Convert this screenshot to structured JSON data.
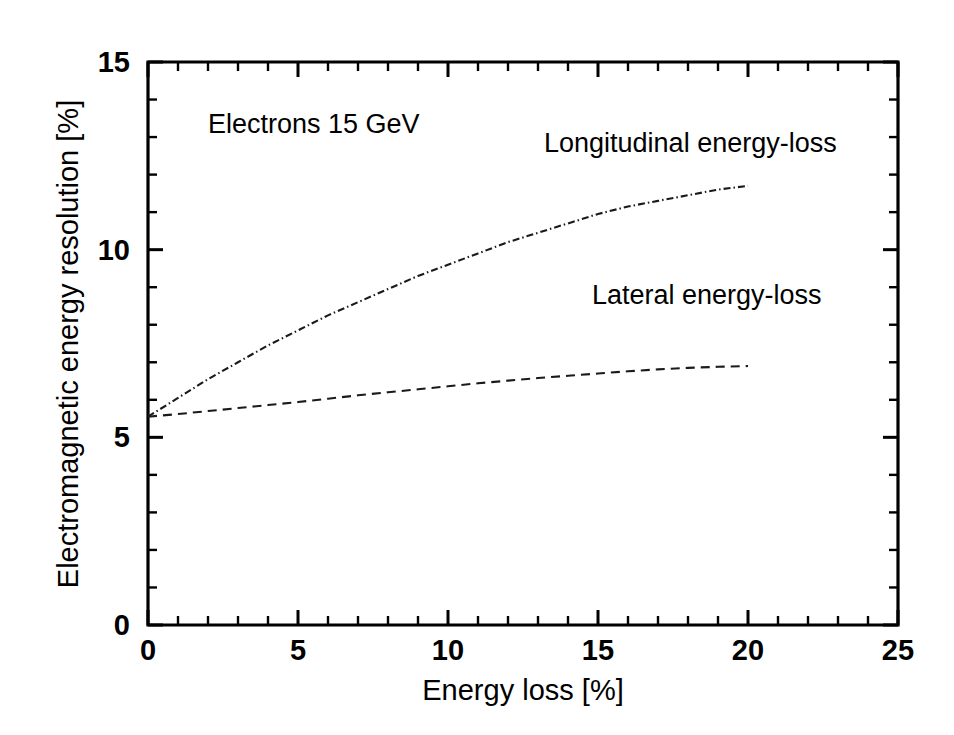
{
  "chart_data": {
    "type": "line",
    "title": "",
    "subtitle": "",
    "xlabel": "Energy loss    [%]",
    "ylabel": "Electromagnetic energy resolution    [%]",
    "xlim": [
      0,
      25
    ],
    "ylim": [
      0,
      15
    ],
    "xticks": [
      0,
      5,
      10,
      15,
      20,
      25
    ],
    "yticks": [
      0,
      5,
      10,
      15
    ],
    "xtick_labels": [
      "0",
      "5",
      "10",
      "15",
      "20",
      "25"
    ],
    "ytick_labels": [
      "0",
      "5",
      "10",
      "15"
    ],
    "x_minor_tick_step": 1,
    "y_minor_tick_step": 1,
    "grid": false,
    "legend_position": "inline-annotations",
    "annotations": [
      {
        "text": "Electrons   15 GeV",
        "x": 2.0,
        "y": 13.1
      },
      {
        "text": "Longitudinal energy-loss",
        "x": 13.2,
        "y": 12.6
      },
      {
        "text": "Lateral energy-loss",
        "x": 14.8,
        "y": 8.55
      }
    ],
    "series": [
      {
        "name": "Longitudinal energy-loss",
        "style": "dash-dot",
        "color": "#1a1a1a",
        "x": [
          0,
          1,
          2,
          3,
          4,
          5,
          6,
          7,
          8,
          9,
          10,
          11,
          12,
          13,
          14,
          15,
          16,
          17,
          18,
          19,
          20
        ],
        "values": [
          5.55,
          6.05,
          6.55,
          7.0,
          7.45,
          7.85,
          8.25,
          8.6,
          8.95,
          9.3,
          9.6,
          9.9,
          10.2,
          10.45,
          10.7,
          10.95,
          11.15,
          11.3,
          11.45,
          11.6,
          11.7
        ]
      },
      {
        "name": "Lateral energy-loss",
        "style": "dashed",
        "color": "#1a1a1a",
        "x": [
          0,
          1,
          2,
          3,
          4,
          5,
          6,
          7,
          8,
          9,
          10,
          11,
          12,
          13,
          14,
          15,
          16,
          17,
          18,
          19,
          20
        ],
        "values": [
          5.55,
          5.62,
          5.7,
          5.78,
          5.86,
          5.94,
          6.03,
          6.12,
          6.2,
          6.28,
          6.36,
          6.44,
          6.51,
          6.58,
          6.64,
          6.7,
          6.76,
          6.81,
          6.85,
          6.88,
          6.9
        ]
      }
    ]
  },
  "figure": {
    "background_color": "#ffffff",
    "axis_color": "#000000"
  }
}
